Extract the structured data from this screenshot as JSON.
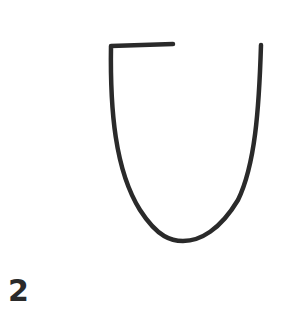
{
  "figure": {
    "label": "2",
    "stroke_color": "#2a2a2a",
    "background": "#ffffff"
  }
}
